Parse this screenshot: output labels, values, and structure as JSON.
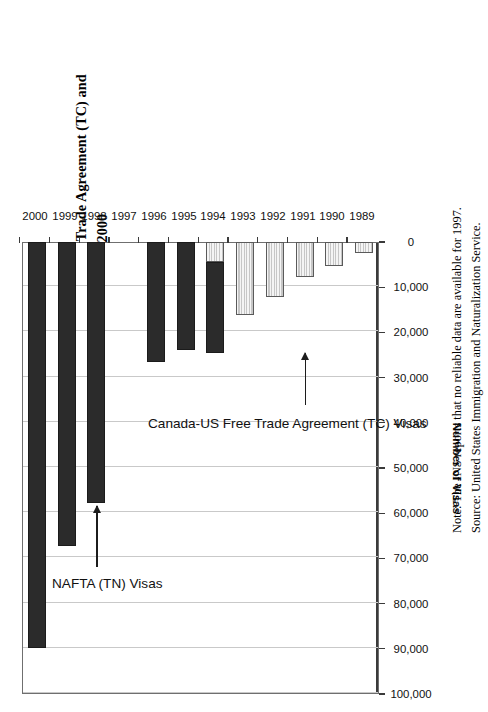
{
  "figure": {
    "title_line1": "Figure 4: Professional Worker Visas Under the Canada-US Free Trade Agreement (TC) and",
    "title_line2": "Under NAFTA (TN), Fiscal Years 1989 to 2000",
    "note": "Note: The INS reports that no reliable data are available for 1997.",
    "source": "Source: United States Immigration and Naturalization Service."
  },
  "annotations": {
    "nafta_label": "NAFTA (TN) Visas",
    "cusfta_label": "Canada-US Free Trade Agreement (TC) Visas"
  },
  "chart_data": {
    "type": "bar",
    "orientation": "horizontal",
    "title": "Figure 4: Professional Worker Visas Under the Canada-US Free Trade Agreement (TC) and Under NAFTA (TN), Fiscal Years 1989 to 2000",
    "xlabel": "",
    "ylabel": "Number of Visas",
    "categories": [
      "1989",
      "1990",
      "1991",
      "1992",
      "1993",
      "1994",
      "1995",
      "1996",
      "1997",
      "1998",
      "1999",
      "2000"
    ],
    "tick_labels": [
      "0",
      "10,000",
      "20,000",
      "30,000",
      "40,000",
      "50,000",
      "60,000",
      "70,000",
      "80,000",
      "90,000",
      "100,000"
    ],
    "ticks": [
      0,
      10000,
      20000,
      30000,
      40000,
      50000,
      60000,
      70000,
      80000,
      90000,
      100000
    ],
    "ylim": [
      0,
      100000
    ],
    "grid": true,
    "legend": "annotations",
    "series": [
      {
        "name": "Canada-US Free Trade Agreement (TC) Visas",
        "color": "#efefef",
        "values": [
          2500,
          5200,
          7700,
          12100,
          16200,
          4500,
          0,
          0,
          null,
          0,
          0,
          0
        ]
      },
      {
        "name": "NAFTA (TN) Visas",
        "color": "#2b2b2b",
        "values": [
          0,
          0,
          0,
          0,
          0,
          20000,
          23800,
          26600,
          null,
          57800,
          67200,
          89800
        ]
      }
    ],
    "totals": [
      2500,
      5200,
      7700,
      12100,
      16200,
      24500,
      23800,
      26600,
      null,
      57800,
      67200,
      89800
    ],
    "missing_data_years": [
      "1997"
    ]
  }
}
